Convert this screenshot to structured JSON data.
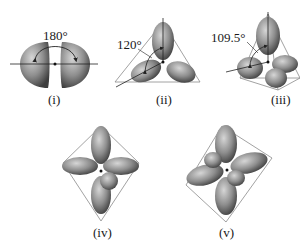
{
  "figure": {
    "panels": [
      {
        "id": "i",
        "caption": "(i)",
        "angle_label": "180°",
        "geometry": "linear",
        "lobes": 2
      },
      {
        "id": "ii",
        "caption": "(ii)",
        "angle_label": "120°",
        "geometry": "trigonal planar",
        "lobes": 3
      },
      {
        "id": "iii",
        "caption": "(iii)",
        "angle_label": "109.5°",
        "geometry": "tetrahedral",
        "lobes": 4
      },
      {
        "id": "iv",
        "caption": "(iv)",
        "angle_label": "",
        "geometry": "trigonal bipyramidal",
        "lobes": 5
      },
      {
        "id": "v",
        "caption": "(v)",
        "angle_label": "",
        "geometry": "octahedral",
        "lobes": 6
      }
    ]
  },
  "colors": {
    "lobe_light": "#b8b8b8",
    "lobe_dark": "#4a4a4a",
    "outline": "#8a8a8a",
    "line": "#222222"
  }
}
